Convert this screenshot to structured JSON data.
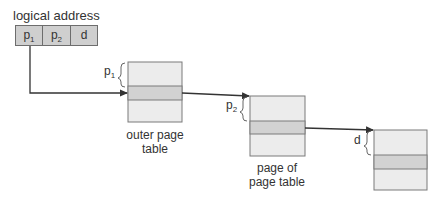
{
  "title": "logical address",
  "address_fields": [
    {
      "base": "p",
      "sub": "1"
    },
    {
      "base": "p",
      "sub": "2"
    },
    {
      "base": "d",
      "sub": ""
    }
  ],
  "tables": [
    {
      "caption_line1": "outer page",
      "caption_line2": "table",
      "offset_label_base": "p",
      "offset_label_sub": "1"
    },
    {
      "caption_line1": "page of",
      "caption_line2": "page table",
      "offset_label_base": "p",
      "offset_label_sub": "2"
    },
    {
      "caption_line1": "",
      "caption_line2": "",
      "offset_label_base": "d",
      "offset_label_sub": ""
    }
  ],
  "colors": {
    "table_fill": "#ececec",
    "entry_fill": "#d2d2d2",
    "border": "#7a7a7a",
    "arrow": "#333333",
    "field_fill": "#cfcfcf"
  }
}
